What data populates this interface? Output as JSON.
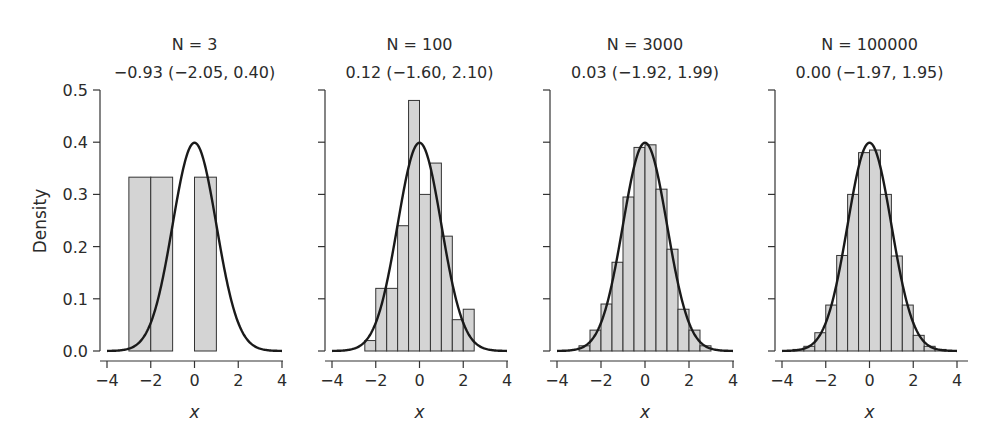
{
  "chart_data": [
    {
      "type": "bar",
      "title": "N = 3",
      "subtitle": "-0.93 (-2.05, 0.40)",
      "xlabel": "x",
      "ylabel": "Density",
      "xlim": [
        -4,
        4
      ],
      "ylim": [
        0,
        0.5
      ],
      "xticks": [
        -4,
        -2,
        0,
        2,
        4
      ],
      "yticks": [
        0.0,
        0.1,
        0.2,
        0.3,
        0.4,
        0.5
      ],
      "bins": [
        {
          "x0": -3,
          "x1": -2,
          "density": 0.333
        },
        {
          "x0": -2,
          "x1": -1,
          "density": 0.333
        },
        {
          "x0": 0,
          "x1": 1,
          "density": 0.333
        }
      ],
      "overlay": "standard normal density N(0,1)"
    },
    {
      "type": "bar",
      "title": "N = 100",
      "subtitle": "0.12 (-1.60, 2.10)",
      "xlabel": "x",
      "xlim": [
        -4,
        4
      ],
      "ylim": [
        0,
        0.5
      ],
      "xticks": [
        -4,
        -2,
        0,
        2,
        4
      ],
      "bins": [
        {
          "x0": -2.5,
          "x1": -2.0,
          "density": 0.02
        },
        {
          "x0": -2.0,
          "x1": -1.5,
          "density": 0.12
        },
        {
          "x0": -1.5,
          "x1": -1.0,
          "density": 0.12
        },
        {
          "x0": -1.0,
          "x1": -0.5,
          "density": 0.24
        },
        {
          "x0": -0.5,
          "x1": 0.0,
          "density": 0.48
        },
        {
          "x0": 0.0,
          "x1": 0.5,
          "density": 0.3
        },
        {
          "x0": 0.5,
          "x1": 1.0,
          "density": 0.36
        },
        {
          "x0": 1.0,
          "x1": 1.5,
          "density": 0.22
        },
        {
          "x0": 1.5,
          "x1": 2.0,
          "density": 0.06
        },
        {
          "x0": 2.0,
          "x1": 2.5,
          "density": 0.08
        }
      ],
      "overlay": "standard normal density N(0,1)"
    },
    {
      "type": "bar",
      "title": "N = 3000",
      "subtitle": "0.03 (-1.92, 1.99)",
      "xlabel": "x",
      "xlim": [
        -4,
        4
      ],
      "ylim": [
        0,
        0.5
      ],
      "xticks": [
        -4,
        -2,
        0,
        2,
        4
      ],
      "bins": [
        {
          "x0": -3.0,
          "x1": -2.5,
          "density": 0.01
        },
        {
          "x0": -2.5,
          "x1": -2.0,
          "density": 0.04
        },
        {
          "x0": -2.0,
          "x1": -1.5,
          "density": 0.09
        },
        {
          "x0": -1.5,
          "x1": -1.0,
          "density": 0.17
        },
        {
          "x0": -1.0,
          "x1": -0.5,
          "density": 0.295
        },
        {
          "x0": -0.5,
          "x1": 0.0,
          "density": 0.39
        },
        {
          "x0": 0.0,
          "x1": 0.5,
          "density": 0.395
        },
        {
          "x0": 0.5,
          "x1": 1.0,
          "density": 0.31
        },
        {
          "x0": 1.0,
          "x1": 1.5,
          "density": 0.195
        },
        {
          "x0": 1.5,
          "x1": 2.0,
          "density": 0.08
        },
        {
          "x0": 2.0,
          "x1": 2.5,
          "density": 0.04
        },
        {
          "x0": 2.5,
          "x1": 3.0,
          "density": 0.01
        }
      ],
      "overlay": "standard normal density N(0,1)"
    },
    {
      "type": "bar",
      "title": "N = 100000",
      "subtitle": "0.00 (-1.97, 1.95)",
      "xlabel": "x",
      "xlim": [
        -4,
        4
      ],
      "ylim": [
        0,
        0.5
      ],
      "xticks": [
        -4,
        -2,
        0,
        2,
        4
      ],
      "bins": [
        {
          "x0": -3.5,
          "x1": -3.0,
          "density": 0.003
        },
        {
          "x0": -3.0,
          "x1": -2.5,
          "density": 0.009
        },
        {
          "x0": -2.5,
          "x1": -2.0,
          "density": 0.035
        },
        {
          "x0": -2.0,
          "x1": -1.5,
          "density": 0.088
        },
        {
          "x0": -1.5,
          "x1": -1.0,
          "density": 0.183
        },
        {
          "x0": -1.0,
          "x1": -0.5,
          "density": 0.3
        },
        {
          "x0": -0.5,
          "x1": 0.0,
          "density": 0.38
        },
        {
          "x0": 0.0,
          "x1": 0.5,
          "density": 0.385
        },
        {
          "x0": 0.5,
          "x1": 1.0,
          "density": 0.3
        },
        {
          "x0": 1.0,
          "x1": 1.5,
          "density": 0.182
        },
        {
          "x0": 1.5,
          "x1": 2.0,
          "density": 0.088
        },
        {
          "x0": 2.0,
          "x1": 2.5,
          "density": 0.03
        },
        {
          "x0": 2.5,
          "x1": 3.0,
          "density": 0.009
        },
        {
          "x0": 3.0,
          "x1": 3.5,
          "density": 0.003
        }
      ],
      "overlay": "standard normal density N(0,1)"
    }
  ],
  "labels": {
    "ylabel": "Density",
    "xlabel": "x",
    "yticks": [
      "0.0",
      "0.1",
      "0.2",
      "0.3",
      "0.4",
      "0.5"
    ],
    "xticks": [
      "−4",
      "−2",
      "0",
      "2",
      "4"
    ],
    "panels": [
      {
        "title": "N = 3",
        "subtitle": "−0.93 (−2.05, 0.40)"
      },
      {
        "title": "N = 100",
        "subtitle": "0.12 (−1.60, 2.10)"
      },
      {
        "title": "N = 3000",
        "subtitle": "0.03 (−1.92, 1.99)"
      },
      {
        "title": "N = 100000",
        "subtitle": "0.00 (−1.97, 1.95)"
      }
    ]
  },
  "colors": {
    "bar_fill": "#d4d4d4",
    "bar_stroke": "#333333",
    "curve": "#1a1a1a",
    "axis": "#333333",
    "text": "#2b2b2b"
  }
}
